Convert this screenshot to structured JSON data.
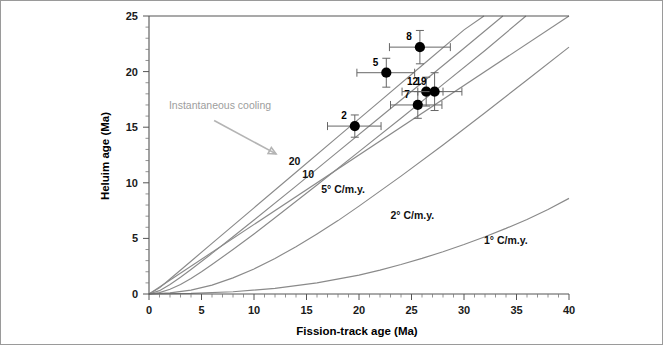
{
  "chart_data": {
    "type": "scatter",
    "title": "",
    "xlabel": "Fission-track age (Ma)",
    "ylabel": "Heluim age (Ma)",
    "xlim": [
      0,
      40
    ],
    "ylim": [
      0,
      25
    ],
    "xticks": [
      0,
      5,
      10,
      15,
      20,
      25,
      30,
      35,
      40
    ],
    "yticks": [
      0,
      5,
      10,
      15,
      20,
      25
    ],
    "xtick_labels": [
      "0",
      "5",
      "10",
      "15",
      "20",
      "25",
      "30",
      "35",
      "40"
    ],
    "ytick_labels": [
      "0",
      "5",
      "10",
      "15",
      "20",
      "25"
    ],
    "minor_tick_step": 1,
    "grid": false,
    "legend": "none",
    "point_color": "#000000",
    "curve_color": "#8a8a8a",
    "annotation_color": "#9d9d9d",
    "points": [
      {
        "label": "2",
        "x": 19.6,
        "y": 15.1,
        "xerr_low": 2.6,
        "xerr_high": 2.5,
        "yerr_low": 1.0,
        "yerr_high": 1.0
      },
      {
        "label": "5",
        "x": 22.6,
        "y": 19.9,
        "xerr_low": 2.8,
        "xerr_high": 2.7,
        "yerr_low": 1.3,
        "yerr_high": 1.3
      },
      {
        "label": "7",
        "x": 25.6,
        "y": 17.0,
        "xerr_low": 2.6,
        "xerr_high": 2.3,
        "yerr_low": 1.2,
        "yerr_high": 1.2
      },
      {
        "label": "8",
        "x": 25.8,
        "y": 22.2,
        "xerr_low": 2.9,
        "xerr_high": 2.9,
        "yerr_low": 1.5,
        "yerr_high": 1.5
      },
      {
        "label": "12",
        "x": 26.4,
        "y": 18.2,
        "xerr_low": 2.3,
        "xerr_high": 1.6,
        "yerr_low": 1.3,
        "yerr_high": 1.3
      },
      {
        "label": "19",
        "x": 27.2,
        "y": 18.2,
        "xerr_low": 1.6,
        "xerr_high": 2.6,
        "yerr_low": 1.7,
        "yerr_high": 1.7
      }
    ],
    "curves": [
      {
        "name": "instantaneous-cooling",
        "label": "",
        "points": [
          [
            0,
            0
          ],
          [
            40,
            25
          ]
        ]
      },
      {
        "name": "cooling-rate-20",
        "label": "20",
        "label_x": 13.3,
        "label_y": 11.6,
        "points": [
          [
            0,
            0
          ],
          [
            1,
            0.55
          ],
          [
            2,
            1.35
          ],
          [
            4,
            2.95
          ],
          [
            6,
            4.55
          ],
          [
            8,
            6.15
          ],
          [
            10,
            7.75
          ],
          [
            14,
            10.95
          ],
          [
            18,
            14.15
          ],
          [
            22,
            17.35
          ],
          [
            26,
            20.55
          ],
          [
            30,
            23.75
          ],
          [
            31.9,
            25.0
          ]
        ]
      },
      {
        "name": "cooling-rate-10",
        "label": "10",
        "label_x": 14.6,
        "label_y": 10.4,
        "points": [
          [
            0,
            0
          ],
          [
            1,
            0.3
          ],
          [
            2,
            0.85
          ],
          [
            3,
            1.5
          ],
          [
            4,
            2.2
          ],
          [
            6,
            3.65
          ],
          [
            8,
            5.15
          ],
          [
            10,
            6.65
          ],
          [
            14,
            9.7
          ],
          [
            18,
            12.8
          ],
          [
            22,
            15.9
          ],
          [
            26,
            19.0
          ],
          [
            30,
            22.1
          ],
          [
            33.7,
            25.0
          ]
        ]
      },
      {
        "name": "cooling-rate-5",
        "label": "5° C/m.y.",
        "label_x": 16.4,
        "label_y": 9.1,
        "points": [
          [
            0,
            0
          ],
          [
            1,
            0.12
          ],
          [
            2,
            0.42
          ],
          [
            3,
            0.85
          ],
          [
            4,
            1.4
          ],
          [
            5,
            2.0
          ],
          [
            6,
            2.65
          ],
          [
            8,
            4.0
          ],
          [
            10,
            5.4
          ],
          [
            12,
            6.85
          ],
          [
            16,
            9.8
          ],
          [
            20,
            12.8
          ],
          [
            24,
            15.8
          ],
          [
            28,
            18.85
          ],
          [
            32,
            21.9
          ],
          [
            35.9,
            25.0
          ]
        ]
      },
      {
        "name": "cooling-rate-2",
        "label": "2° C/m.y.",
        "label_x": 23.0,
        "label_y": 6.7,
        "points": [
          [
            0,
            0
          ],
          [
            2,
            0.1
          ],
          [
            4,
            0.35
          ],
          [
            6,
            0.8
          ],
          [
            8,
            1.45
          ],
          [
            10,
            2.25
          ],
          [
            12,
            3.2
          ],
          [
            14,
            4.25
          ],
          [
            16,
            5.4
          ],
          [
            18,
            6.6
          ],
          [
            20,
            7.9
          ],
          [
            24,
            10.6
          ],
          [
            28,
            13.4
          ],
          [
            32,
            16.3
          ],
          [
            36,
            19.25
          ],
          [
            40,
            22.2
          ]
        ]
      },
      {
        "name": "cooling-rate-1",
        "label": "1° C/m.y.",
        "label_x": 31.9,
        "label_y": 4.5,
        "points": [
          [
            0,
            0
          ],
          [
            4,
            0.05
          ],
          [
            8,
            0.2
          ],
          [
            12,
            0.5
          ],
          [
            16,
            1.0
          ],
          [
            20,
            1.7
          ],
          [
            22,
            2.15
          ],
          [
            24,
            2.65
          ],
          [
            26,
            3.2
          ],
          [
            28,
            3.8
          ],
          [
            30,
            4.45
          ],
          [
            32,
            5.15
          ],
          [
            34,
            5.9
          ],
          [
            36,
            6.7
          ],
          [
            38,
            7.6
          ],
          [
            40,
            8.6
          ]
        ]
      }
    ],
    "annotations": [
      {
        "name": "instantaneous-cooling-annotation",
        "text": "Instantaneous cooling",
        "text_x": 1.9,
        "text_y": 16.6,
        "arrow_from_x": 6.2,
        "arrow_from_y": 15.6,
        "arrow_to_x": 12.1,
        "arrow_to_y": 12.6
      }
    ]
  }
}
